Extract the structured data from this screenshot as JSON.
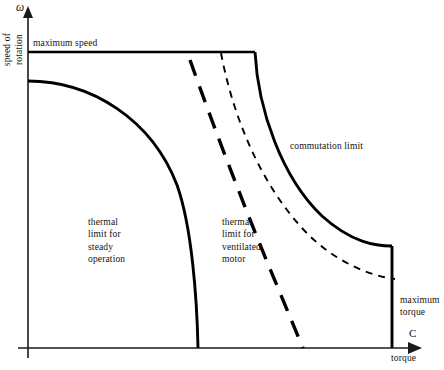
{
  "figure": {
    "title": "",
    "axes": {
      "y_symbol": "ω",
      "y_label": "speed of\nrotation",
      "x_symbol": "C",
      "x_label": "torque",
      "origin_px": [
        28,
        348
      ],
      "x_axis_end_px": [
        420,
        348
      ],
      "y_axis_top_px": [
        28,
        10
      ]
    },
    "annotations": {
      "maximum_speed": "maximum speed",
      "commutation_limit": "commutation limit",
      "thermal_limit_steady": "thermal\nlimit for\nsteady\noperation",
      "thermal_limit_ventilated": "thermal\nlimit for\nventilated\nmotor",
      "maximum_torque": "maximum\ntorque"
    }
  },
  "chart_data": {
    "type": "line",
    "xlabel": "torque",
    "ylabel": "speed of rotation",
    "x_symbol": "C",
    "y_symbol": "ω",
    "grid": false,
    "legend": "inline-annotations",
    "xlim": [
      0,
      420
    ],
    "ylim": [
      0,
      348
    ],
    "series": [
      {
        "name": "maximum speed",
        "style": "solid",
        "stroke": "#000000",
        "width": 2.4,
        "path": "M 28 52 L 255 52"
      },
      {
        "name": "commutation limit",
        "style": "solid",
        "stroke": "#000000",
        "width": 2.9,
        "path": "M 255 52 C 258 110, 282 178, 322 216 C 352 243, 376 246, 392 246"
      },
      {
        "name": "maximum torque",
        "style": "solid",
        "stroke": "#000000",
        "width": 2.9,
        "path": "M 392 246 L 392 348"
      },
      {
        "name": "thermal limit for steady operation",
        "style": "solid",
        "stroke": "#000000",
        "width": 2.9,
        "path": "M 28 81 C 92 81, 152 120, 177 185 C 192 227, 197 300, 198 348"
      },
      {
        "name": "thermal limit for ventilated motor",
        "style": "long-dash",
        "stroke": "#000000",
        "width": 3.4,
        "dash": [
          17,
          11
        ],
        "path": "M 190 60 C 214 128, 250 222, 278 288 C 288 312, 297 334, 303 348"
      },
      {
        "name": "intermediate limit",
        "style": "short-dash",
        "stroke": "#000000",
        "width": 1.9,
        "dash": [
          7,
          6
        ],
        "path": "M 221 53 C 232 112, 258 180, 302 228 C 332 261, 370 276, 395 279"
      }
    ],
    "annotated_points": [
      {
        "label": "maximum speed",
        "at_px": [
          33,
          37
        ]
      },
      {
        "label": "commutation limit",
        "at_px": [
          290,
          140
        ]
      },
      {
        "label": "thermal limit for steady operation",
        "at_px": [
          88,
          216
        ]
      },
      {
        "label": "thermal limit for ventilated motor",
        "at_px": [
          222,
          216
        ]
      },
      {
        "label": "maximum torque",
        "at_px": [
          400,
          294
        ]
      }
    ]
  }
}
